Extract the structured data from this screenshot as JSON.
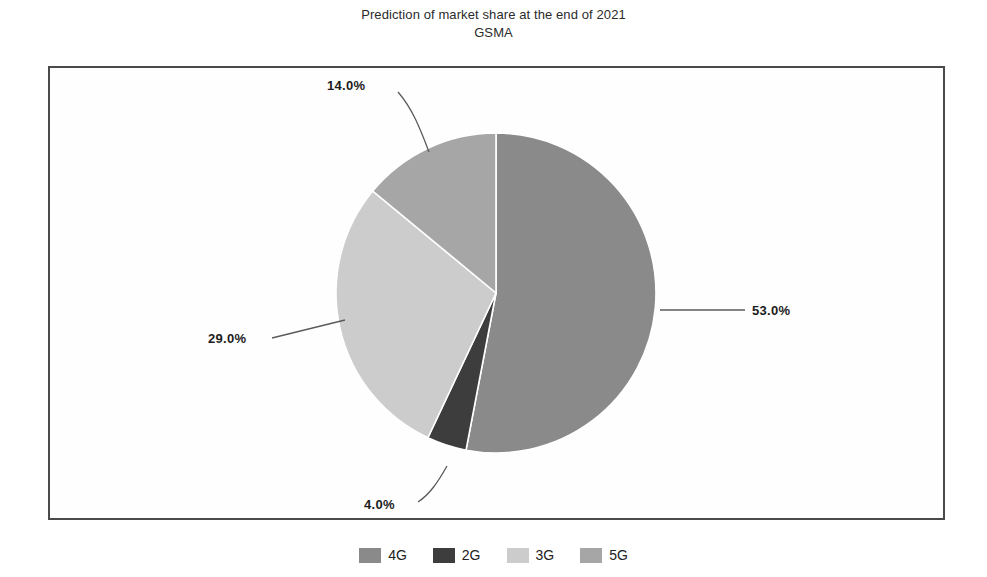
{
  "header": {
    "title": "Prediction of market share at the end of 2021",
    "subtitle": "GSMA"
  },
  "chart_data": {
    "type": "pie",
    "title": "Prediction of market share at the end of 2021",
    "subtitle": "GSMA",
    "xlabel": "",
    "ylabel": "",
    "categories": [
      "4G",
      "2G",
      "3G",
      "5G"
    ],
    "values": [
      53.0,
      4.0,
      29.0,
      14.0
    ],
    "value_labels": [
      "53.0%",
      "4.0%",
      "29.0%",
      "14.0%"
    ],
    "colors": [
      "#8a8a8a",
      "#3d3d3d",
      "#cccccc",
      "#a6a6a6"
    ],
    "start_angle_deg": 90,
    "direction": "clockwise",
    "units": "percent",
    "legend_position": "bottom",
    "grid": false,
    "slices": [
      {
        "name": "4G",
        "value": 53.0,
        "label": "53.0%",
        "color": "#8a8a8a"
      },
      {
        "name": "2G",
        "value": 4.0,
        "label": "4.0%",
        "color": "#3d3d3d"
      },
      {
        "name": "3G",
        "value": 29.0,
        "label": "29.0%",
        "color": "#cccccc"
      },
      {
        "name": "5G",
        "value": 14.0,
        "label": "14.0%",
        "color": "#a6a6a6"
      }
    ]
  },
  "legend": {
    "items": [
      {
        "label": "4G",
        "color": "#8a8a8a"
      },
      {
        "label": "2G",
        "color": "#3d3d3d"
      },
      {
        "label": "3G",
        "color": "#cccccc"
      },
      {
        "label": "5G",
        "color": "#a6a6a6"
      }
    ]
  }
}
